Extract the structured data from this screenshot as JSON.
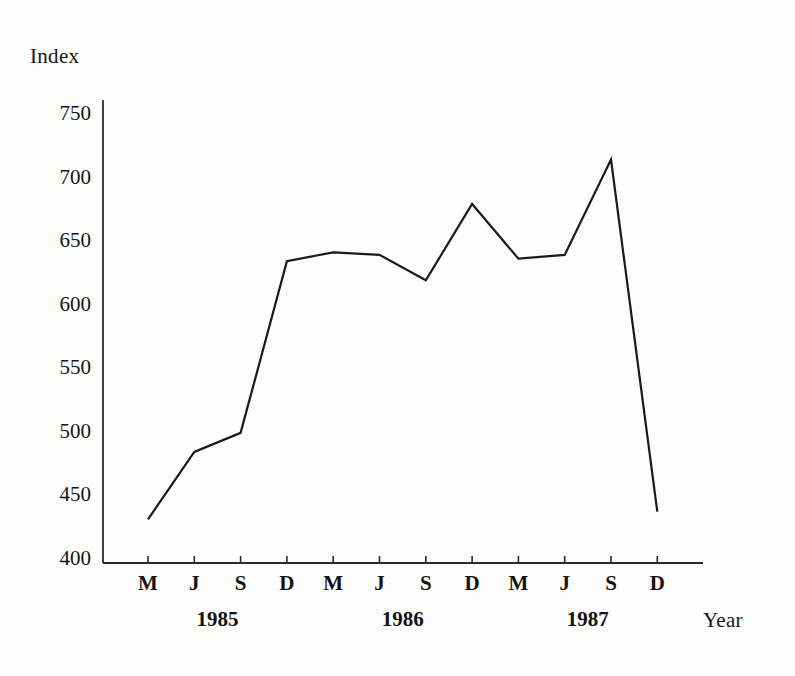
{
  "chart_data": {
    "type": "line",
    "title": "",
    "ylabel": "Index",
    "xlabel": "Year",
    "ylim": [
      400,
      750
    ],
    "yticks": [
      400,
      450,
      500,
      550,
      600,
      650,
      700,
      750
    ],
    "grid": false,
    "legend": "none",
    "categories": [
      "M",
      "J",
      "S",
      "D",
      "M",
      "J",
      "S",
      "D",
      "M",
      "J",
      "S",
      "D"
    ],
    "year_groups": [
      {
        "label": "1985",
        "start_index": 0,
        "end_index": 3
      },
      {
        "label": "1986",
        "start_index": 4,
        "end_index": 7
      },
      {
        "label": "1987",
        "start_index": 8,
        "end_index": 11
      }
    ],
    "points": [
      {
        "x_label": "M",
        "year": "1985",
        "value": 432
      },
      {
        "x_label": "J",
        "year": "1985",
        "value": 485
      },
      {
        "x_label": "S",
        "year": "1985",
        "value": 500
      },
      {
        "x_label": "D",
        "year": "1985",
        "value": 635
      },
      {
        "x_label": "M",
        "year": "1986",
        "value": 642
      },
      {
        "x_label": "J",
        "year": "1986",
        "value": 640
      },
      {
        "x_label": "S",
        "year": "1986",
        "value": 620
      },
      {
        "x_label": "D",
        "year": "1986",
        "value": 680
      },
      {
        "x_label": "M",
        "year": "1987",
        "value": 637
      },
      {
        "x_label": "J",
        "year": "1987",
        "value": 640
      },
      {
        "x_label": "S",
        "year": "1987",
        "value": 715
      },
      {
        "x_label": "D",
        "year": "1987",
        "value": 438
      }
    ],
    "values": [
      432,
      485,
      500,
      635,
      642,
      640,
      620,
      680,
      637,
      640,
      715,
      438
    ],
    "series": [
      {
        "name": "Index",
        "values": [
          432,
          485,
          500,
          635,
          642,
          640,
          620,
          680,
          637,
          640,
          715,
          438
        ]
      }
    ]
  },
  "style": {
    "line_color": "#1a1a1a",
    "axis_color": "#2b2b2b",
    "background": "#fdfdfb",
    "text_color": "#141414"
  },
  "geometry": {
    "plot_left": 103,
    "plot_right": 703,
    "plot_top": 100,
    "plot_bottom": 563,
    "y_value_top": 750,
    "y_value_bottom": 400,
    "y_pixel_top": 115,
    "y_pixel_bottom": 560,
    "x_first_tick": 148,
    "x_tick_spacing": 46.3
  }
}
